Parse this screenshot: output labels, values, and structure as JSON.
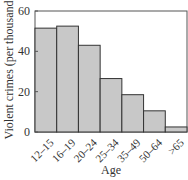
{
  "chart_data": {
    "type": "bar",
    "title": "",
    "xlabel": "Age",
    "ylabel": "Violent crimes (per thousand)",
    "categories": [
      "12–15",
      "16–19",
      "20–24",
      "25–34",
      "35–49",
      "50–64",
      ">65"
    ],
    "values": [
      51.5,
      52.5,
      43,
      26.5,
      18.5,
      10.5,
      2.5
    ],
    "ylim": [
      0,
      60
    ],
    "yticks": [
      0,
      20,
      40,
      60
    ],
    "grid": false,
    "legend": null,
    "colors": {
      "bar_fill": "#c8c8c8",
      "bar_stroke": "#333333",
      "frame": "#555555"
    }
  }
}
